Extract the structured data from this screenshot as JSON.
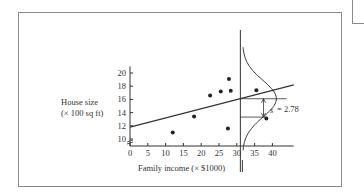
{
  "figure": {
    "ylabel_line1": "House size",
    "ylabel_line2": "(× 100 sq ft)",
    "xlabel": "Family income (× $1000)",
    "annotation": "= 2.78",
    "annotation_symbol": "s"
  },
  "chart_data": {
    "type": "scatter",
    "title": "",
    "xlabel": "Family income (× $1000)",
    "ylabel": "House size (× 100 sq ft)",
    "x_ticks": [
      0,
      5,
      10,
      15,
      20,
      25,
      30,
      35,
      40
    ],
    "y_ticks": [
      10,
      12,
      14,
      16,
      18,
      20
    ],
    "xlim": [
      0,
      45
    ],
    "ylim": [
      9,
      21
    ],
    "grid": false,
    "series": [
      {
        "name": "observations",
        "points": [
          {
            "x": 12,
            "y": 11.0
          },
          {
            "x": 18,
            "y": 13.4
          },
          {
            "x": 22.5,
            "y": 16.6
          },
          {
            "x": 25.5,
            "y": 17.2
          },
          {
            "x": 27.8,
            "y": 19.1
          },
          {
            "x": 28.3,
            "y": 17.3
          },
          {
            "x": 27.5,
            "y": 11.6
          },
          {
            "x": 35.5,
            "y": 17.4
          },
          {
            "x": 38.3,
            "y": 13.1
          }
        ]
      },
      {
        "name": "regression line",
        "type": "line",
        "points": [
          {
            "x": 0,
            "y": 11.8
          },
          {
            "x": 46,
            "y": 18.2
          }
        ]
      }
    ],
    "annotations": [
      {
        "text": "s = 2.78",
        "description": "standard deviation of normal distribution of residuals drawn at x≈31"
      }
    ],
    "normal_curve": {
      "center_x": 31,
      "mean_y": 16.1,
      "sd": 2.78
    }
  }
}
